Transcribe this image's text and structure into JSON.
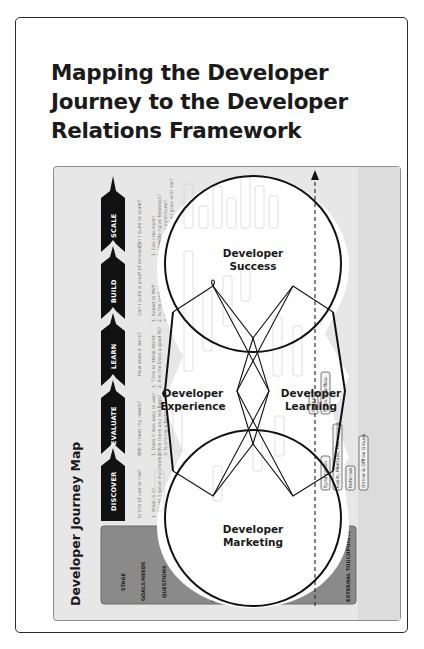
{
  "card": {
    "title": "Mapping the Developer Journey to the Developer Relations Framework"
  },
  "journey_map": {
    "title": "Developer Journey Map",
    "row_headers": {
      "stage": "STAGE",
      "goals": "GOALS/NEEDS",
      "questions": "QUESTIONS",
      "internal": "INTERNAL TOUCHPOINTS",
      "external": "EXTERNAL TOUCHPOINTS"
    },
    "stages": [
      {
        "name": "DISCOVER",
        "goal": "Is this of use to me?",
        "questions": [
          "1. What is it?",
          "2. Could it solve my problem?"
        ]
      },
      {
        "name": "EVALUATE",
        "goal": "Will it meet my needs?",
        "questions": [
          "1. Does it look easy to use?",
          "2. Are there any red flags?",
          "3. Is pricing a factor?"
        ]
      },
      {
        "name": "LEARN",
        "goal": "How does it work?",
        "questions": [
          "1. Time to 'Hello World'",
          "2. Are the Docs a good fit?"
        ]
      },
      {
        "name": "BUILD",
        "goal": "Can I build a proof of concept?",
        "questions": [
          "1. Speed to MVP",
          "2. Is the product a good experience?",
          "3. How do I get help?"
        ]
      },
      {
        "name": "SCALE",
        "goal": "Can I build to scale?",
        "questions": [
          "1. Can I do more?",
          "2. How do I give feedback?",
          "3. How can I contribute?",
          "4. Will the product grow with me?"
        ]
      }
    ],
    "internal_touchpoints_ghost": [
      "Developer Success",
      "SLA",
      "Product Expertise",
      "Roadmap",
      "Ambassador Program",
      "Partner Program",
      "Certification",
      "PRODUCT + DOCS",
      "DEVELOPER EXPERIENCE",
      "Quick Start Guides",
      "Tutorials",
      "Samples",
      "Changelog",
      "Support",
      "Dev Hub",
      "Landing Page",
      "Case Studies",
      "Pricing Page",
      "Sign Up",
      "Learning Resources"
    ],
    "external_touchpoints": [
      "GitHub",
      "Stack Overflow",
      "Syndication",
      "Event, Meetups, Hackathons",
      "Referrals",
      "Online & Offline Groups"
    ]
  },
  "framework": {
    "areas": [
      {
        "line1": "Developer",
        "line2": "Success"
      },
      {
        "line1": "Developer",
        "line2": "Experience"
      },
      {
        "line1": "Developer",
        "line2": "Learning"
      },
      {
        "line1": "Developer",
        "line2": "Marketing"
      }
    ]
  },
  "colors": {
    "map_bg": "#e6e6e6",
    "stage_arrow": "#111111",
    "band": "#8a8a8a",
    "outline": "#111111"
  }
}
